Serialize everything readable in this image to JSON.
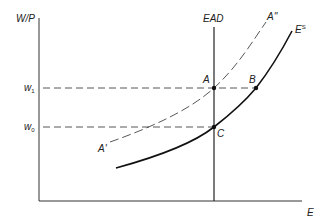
{
  "diagram": {
    "type": "economics-labor-market",
    "axes": {
      "y_label": "W/P",
      "x_label": "E"
    },
    "y_ticks": [
      {
        "label": "w",
        "sub": "1",
        "y": 88
      },
      {
        "label": "w",
        "sub": "0",
        "y": 127
      }
    ],
    "curves": [
      {
        "name": "EAD",
        "label": "EAD",
        "style": "solid",
        "kind": "vertical"
      },
      {
        "name": "E^S",
        "label": "E",
        "sup": "S",
        "style": "solid"
      },
      {
        "name": "A'A''",
        "label_start": "A'",
        "label_end": "A''",
        "style": "dashed"
      }
    ],
    "points": [
      {
        "label": "A",
        "x": 214,
        "y": 88
      },
      {
        "label": "B",
        "x": 256,
        "y": 88
      },
      {
        "label": "C",
        "x": 214,
        "y": 127
      }
    ],
    "colors": {
      "line": "#222222",
      "dashed": "#444444",
      "background": "#ffffff"
    }
  }
}
